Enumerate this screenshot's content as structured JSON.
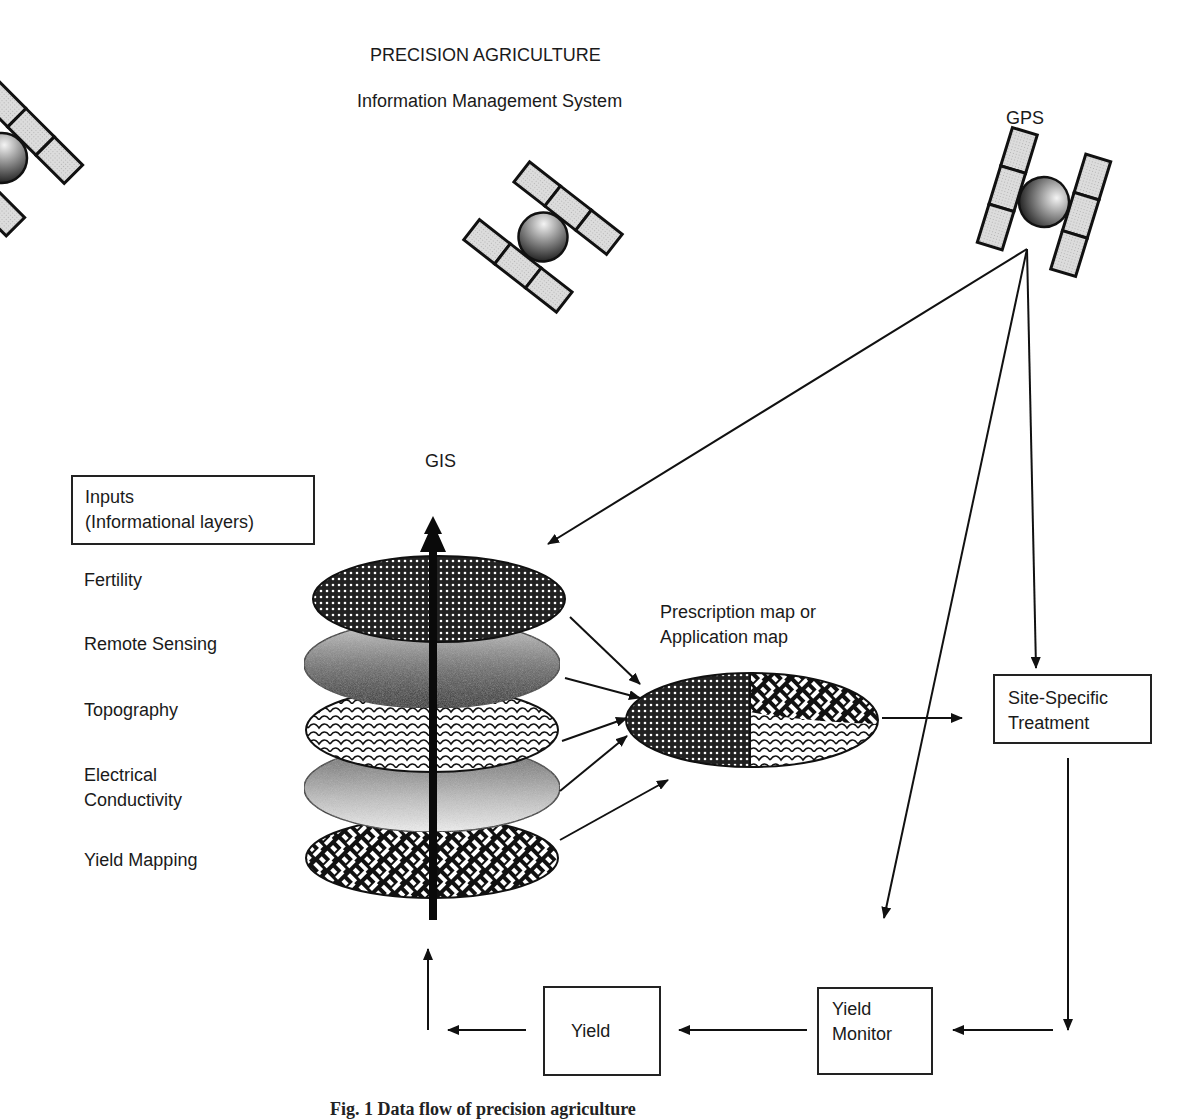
{
  "title": "PRECISION AGRICULTURE",
  "subtitle": "Information Management System",
  "labels": {
    "gps": "GPS",
    "gis": "GIS",
    "prescription_map": [
      "Prescription map or",
      "Application map"
    ]
  },
  "inputs_box": {
    "line1": "Inputs",
    "line2": "(Informational layers)"
  },
  "input_layers": [
    {
      "label": "Fertility",
      "pattern": "dense-dot"
    },
    {
      "label": "Remote Sensing",
      "pattern": "gradient-stipple"
    },
    {
      "label": "Topography",
      "pattern": "scales"
    },
    {
      "label": "Electrical",
      "label2": "Conductivity",
      "pattern": "light-gradient"
    },
    {
      "label": "Yield Mapping",
      "pattern": "weave"
    }
  ],
  "process_boxes": {
    "site_specific": [
      "Site-Specific",
      "Treatment"
    ],
    "yield_monitor": [
      "Yield",
      "Monitor"
    ],
    "yield": "Yield"
  },
  "icons": [
    "satellite-icon",
    "satellite-icon",
    "satellite-icon"
  ],
  "caption": "Fig. 1  Data flow of precision agriculture",
  "colors": {
    "ink": "#111111",
    "panel_fill": "#d9d9d9",
    "background": "#ffffff"
  }
}
